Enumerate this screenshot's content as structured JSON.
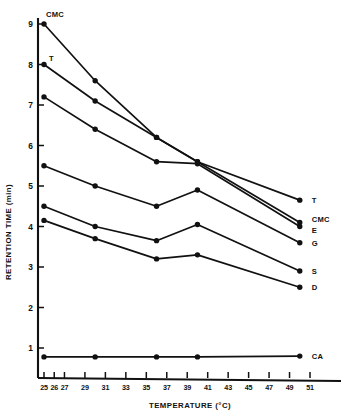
{
  "chart_data": {
    "type": "line",
    "title": "",
    "xlabel": "TEMPERATURE (°C)",
    "ylabel": "RETENTION TIME (min)",
    "xlim": [
      25,
      52
    ],
    "ylim": [
      0,
      9.4
    ],
    "grid": false,
    "legend_position": "right-of-plot-end-labels",
    "xticks": [
      25,
      26,
      27,
      29,
      31,
      33,
      35,
      37,
      39,
      41,
      43,
      45,
      47,
      49,
      51
    ],
    "xtick_labels": [
      "25",
      "26",
      "27",
      "29",
      "31",
      "33",
      "35",
      "37",
      "39",
      "41",
      "43",
      "45",
      "47",
      "49",
      "51"
    ],
    "yticks": [
      1,
      2,
      3,
      4,
      5,
      6,
      7,
      8,
      9
    ],
    "ytick_labels": [
      "1",
      "2",
      "3",
      "4",
      "5",
      "6",
      "7",
      "8",
      "9"
    ],
    "x": [
      25,
      30,
      36,
      40,
      50
    ],
    "series": [
      {
        "name": "CMC",
        "label_right": "CMC",
        "label_left": "CMC",
        "values": [
          9.0,
          7.6,
          6.2,
          5.6,
          4.1
        ]
      },
      {
        "name": "T",
        "label_right": "T",
        "label_left": "T",
        "values": [
          8.0,
          7.1,
          6.2,
          5.6,
          4.65
        ]
      },
      {
        "name": "E",
        "label_right": "E",
        "label_left": "",
        "values": [
          7.2,
          6.4,
          5.6,
          5.55,
          4.0
        ]
      },
      {
        "name": "G",
        "label_right": "G",
        "label_left": "",
        "values": [
          5.5,
          5.0,
          4.5,
          4.9,
          3.6
        ]
      },
      {
        "name": "S",
        "label_right": "S",
        "label_left": "",
        "values": [
          4.5,
          4.0,
          3.65,
          4.05,
          2.9
        ]
      },
      {
        "name": "D",
        "label_right": "D",
        "label_left": "",
        "values": [
          4.15,
          3.7,
          3.2,
          3.3,
          2.5
        ]
      },
      {
        "name": "CA",
        "label_right": "CA",
        "label_left": "",
        "values": [
          0.78,
          0.78,
          0.78,
          0.78,
          0.8
        ]
      }
    ],
    "series_colors": {
      "all": "#111111"
    },
    "annotations": [
      {
        "text": "CMC",
        "x": 25,
        "y": 9.0,
        "position": "above-left-start"
      },
      {
        "text": "T",
        "x": 25,
        "y": 8.0,
        "position": "above-right-start"
      }
    ]
  }
}
